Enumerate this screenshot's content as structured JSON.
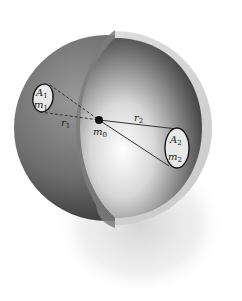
{
  "diagram": {
    "labels": {
      "A1": "A",
      "A1_sub": "1",
      "m1": "m",
      "m1_sub": "1",
      "A2": "A",
      "A2_sub": "2",
      "m2": "m",
      "m2_sub": "2",
      "r1": "r",
      "r1_sub": "1",
      "r2": "r",
      "r2_sub": "2",
      "m0": "m",
      "m0_sub": "0"
    },
    "colors": {
      "background": "#ffffff",
      "shell_outer_dark": "#4a4a4a",
      "shell_outer_mid": "#8a8a8a",
      "shell_cut_face": "#d6d6d6",
      "inner_dark": "#3a3a3a",
      "inner_light": "#f4f4f4",
      "line": "#333333",
      "dot": "#111111",
      "patch_fill": "#e8e8e8"
    }
  }
}
